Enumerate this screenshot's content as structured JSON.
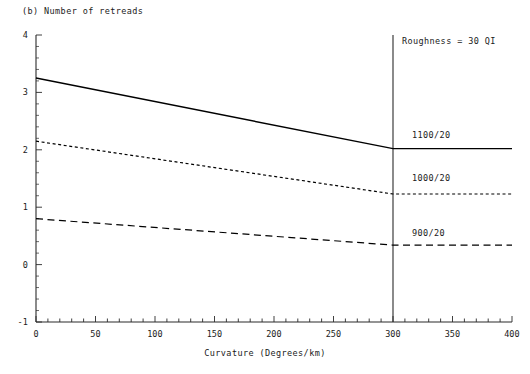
{
  "chart_data": {
    "type": "line",
    "title": "(b) Number of retreads",
    "xlabel": "Curvature (Degrees/km)",
    "ylabel": "",
    "xlim": [
      0,
      400
    ],
    "ylim": [
      -1,
      4
    ],
    "xticks": [
      0,
      50,
      100,
      150,
      200,
      250,
      300,
      350,
      400
    ],
    "xtick_labels": [
      "0",
      "50",
      "100",
      "150",
      "200",
      "250",
      "300",
      "350",
      "400"
    ],
    "x_minor_tick_step": 10,
    "yticks": [
      -1,
      0,
      1,
      2,
      3,
      4
    ],
    "ytick_labels": [
      "-1",
      "0",
      "1",
      "2",
      "3",
      "4"
    ],
    "y_minor_tick_step": 0.2,
    "grid": false,
    "legend_position": "inline-right",
    "annotations": [
      {
        "name": "roughness-annotation",
        "text": "Roughness = 30 QI",
        "x": 310,
        "y": 3.75
      },
      {
        "name": "vertical-reference-line",
        "text": "",
        "x": 300,
        "y_from": -1,
        "y_to": 4.0
      }
    ],
    "series": [
      {
        "name": "1100/20",
        "label": "1100/20",
        "style": "solid",
        "color": "#000000",
        "x": [
          0,
          300,
          400
        ],
        "values": [
          3.25,
          2.02,
          2.02
        ]
      },
      {
        "name": "1000/20",
        "label": "1000/20",
        "style": "dotted",
        "color": "#000000",
        "x": [
          0,
          300,
          400
        ],
        "values": [
          2.15,
          1.23,
          1.23
        ]
      },
      {
        "name": "900/20",
        "label": "900/20",
        "style": "dashed",
        "color": "#000000",
        "x": [
          0,
          300,
          400
        ],
        "values": [
          0.8,
          0.34,
          0.34
        ]
      }
    ]
  },
  "figure": {
    "title": "(b) Number of retreads",
    "xlabel": "Curvature (Degrees/km)",
    "annotation_roughness": "Roughness = 30 QI",
    "label_1100": "1100/20",
    "label_1000": "1000/20",
    "label_900": "900/20"
  },
  "colors": {
    "axis": "#2b2b2b",
    "line": "#000000",
    "text": "#1a1a1a",
    "background": "#ffffff"
  }
}
